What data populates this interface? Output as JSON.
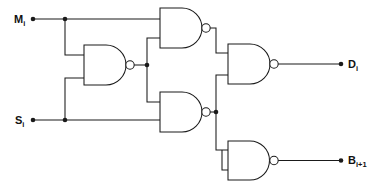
{
  "diagram": {
    "type": "logic-circuit",
    "line_color": "#1a1a1a",
    "background_color": "#ffffff",
    "canvas": {
      "width": 372,
      "height": 189
    }
  },
  "inputs": [
    {
      "id": "Mi",
      "base": "M",
      "subscript": "i",
      "x": 30,
      "y": 19
    },
    {
      "id": "Si",
      "base": "S",
      "subscript": "i",
      "x": 30,
      "y": 120
    }
  ],
  "outputs": [
    {
      "id": "Di",
      "base": "D",
      "subscript": "i",
      "x": 345,
      "y": 68
    },
    {
      "id": "Bi1",
      "base": "B",
      "subscript": "i+1",
      "x": 345,
      "y": 160
    }
  ],
  "gates": [
    {
      "id": "g1",
      "type": "NAND",
      "label": "nand-gate-1",
      "inputs": [
        "Mi",
        "Si"
      ],
      "output": "n1"
    },
    {
      "id": "g2",
      "type": "NAND",
      "label": "nand-gate-2",
      "inputs": [
        "Mi",
        "n1"
      ],
      "output": "n2"
    },
    {
      "id": "g3",
      "type": "NAND",
      "label": "nand-gate-3",
      "inputs": [
        "n1",
        "Si"
      ],
      "output": "n3"
    },
    {
      "id": "g4",
      "type": "NAND",
      "label": "nand-gate-4-difference",
      "inputs": [
        "n2",
        "n3"
      ],
      "output": "Di"
    },
    {
      "id": "g5",
      "type": "NAND",
      "label": "nand-gate-5-borrow",
      "inputs": [
        "n3",
        "n3"
      ],
      "output": "Bi1"
    }
  ],
  "junctions": [
    {
      "id": "j-mi",
      "x": 65,
      "y": 19
    },
    {
      "id": "j-si",
      "x": 65,
      "y": 120
    },
    {
      "id": "j-n1",
      "x": 147,
      "y": 67
    },
    {
      "id": "j-n3",
      "x": 216,
      "y": 112
    }
  ]
}
